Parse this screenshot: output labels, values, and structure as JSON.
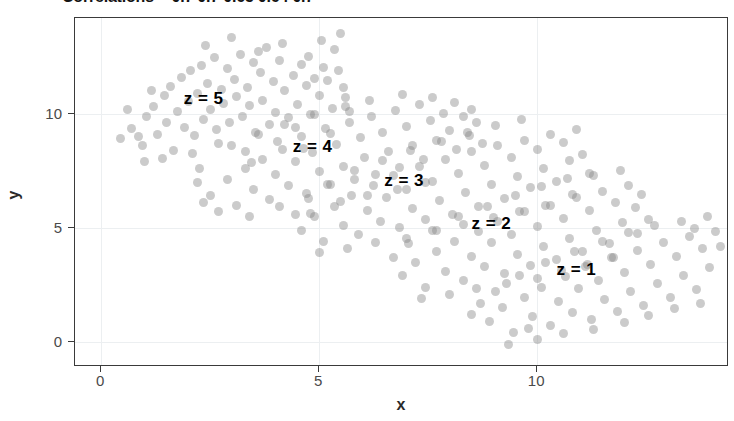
{
  "chart_data": {
    "type": "scatter",
    "title": "Correlations = 0.7 0.7 0.65 0.64 0.7",
    "xlabel": "x",
    "ylabel": "y",
    "xlim": [
      -0.6,
      14.4
    ],
    "ylim": [
      -1.1,
      14.2
    ],
    "xticks": [
      0,
      5,
      10
    ],
    "xticklabels": [
      "0",
      "5",
      "10"
    ],
    "yticks": [
      0,
      5,
      10
    ],
    "yticklabels": [
      "0",
      "5",
      "10"
    ],
    "grid": true,
    "legend": "none",
    "point_color": "#828282",
    "point_alpha": 0.42,
    "annotations": [
      {
        "text": "z = 5",
        "x": 2.35,
        "y": 10.65
      },
      {
        "text": "z = 4",
        "x": 4.85,
        "y": 8.55
      },
      {
        "text": "z = 3",
        "x": 6.95,
        "y": 7.05
      },
      {
        "text": "z = 2",
        "x": 8.95,
        "y": 5.15
      },
      {
        "text": "z = 1",
        "x": 10.9,
        "y": 3.15
      }
    ],
    "series": [
      {
        "name": "z = 5",
        "correlation": 0.7,
        "points": [
          [
            0.45,
            8.9
          ],
          [
            0.7,
            9.35
          ],
          [
            0.95,
            8.6
          ],
          [
            1.05,
            9.9
          ],
          [
            1.2,
            10.3
          ],
          [
            1.3,
            9.1
          ],
          [
            1.45,
            10.8
          ],
          [
            1.5,
            9.6
          ],
          [
            1.6,
            11.2
          ],
          [
            1.65,
            8.4
          ],
          [
            1.75,
            10.1
          ],
          [
            1.85,
            11.6
          ],
          [
            1.9,
            9.4
          ],
          [
            2.0,
            10.55
          ],
          [
            2.05,
            11.9
          ],
          [
            2.15,
            9.05
          ],
          [
            2.2,
            10.9
          ],
          [
            2.3,
            12.1
          ],
          [
            2.35,
            9.75
          ],
          [
            2.45,
            11.35
          ],
          [
            2.5,
            10.2
          ],
          [
            2.6,
            12.45
          ],
          [
            2.65,
            9.3
          ],
          [
            2.75,
            11.05
          ],
          [
            2.8,
            10.45
          ],
          [
            2.9,
            12.0
          ],
          [
            2.95,
            9.6
          ],
          [
            3.05,
            11.5
          ],
          [
            3.1,
            10.75
          ],
          [
            3.2,
            12.6
          ],
          [
            3.25,
            9.9
          ],
          [
            3.35,
            11.15
          ],
          [
            3.4,
            10.35
          ],
          [
            3.5,
            12.25
          ],
          [
            3.55,
            9.2
          ],
          [
            3.65,
            11.8
          ],
          [
            3.7,
            10.6
          ],
          [
            3.8,
            12.9
          ],
          [
            3.85,
            9.55
          ],
          [
            3.95,
            11.4
          ],
          [
            4.0,
            10.05
          ],
          [
            4.1,
            12.35
          ],
          [
            4.2,
            11.0
          ],
          [
            4.3,
            9.85
          ],
          [
            4.4,
            11.7
          ],
          [
            4.5,
            10.4
          ],
          [
            4.6,
            12.15
          ],
          [
            4.7,
            11.25
          ],
          [
            4.8,
            9.95
          ],
          [
            4.9,
            11.55
          ],
          [
            5.0,
            10.8
          ],
          [
            5.1,
            12.05
          ],
          [
            5.2,
            11.45
          ],
          [
            5.3,
            10.25
          ],
          [
            5.45,
            11.9
          ],
          [
            5.6,
            10.7
          ],
          [
            1.0,
            7.9
          ],
          [
            1.4,
            8.05
          ],
          [
            2.1,
            8.25
          ],
          [
            2.7,
            8.7
          ],
          [
            3.3,
            8.35
          ],
          [
            4.05,
            8.8
          ],
          [
            4.65,
            8.5
          ],
          [
            5.25,
            9.15
          ],
          [
            2.4,
            13.0
          ],
          [
            3.0,
            13.35
          ],
          [
            3.6,
            12.75
          ],
          [
            4.15,
            13.1
          ],
          [
            4.75,
            12.5
          ],
          [
            5.35,
            12.8
          ],
          [
            5.5,
            13.5
          ],
          [
            5.05,
            13.2
          ],
          [
            0.6,
            10.2
          ],
          [
            0.85,
            9.0
          ],
          [
            1.15,
            11.0
          ],
          [
            5.55,
            11.15
          ],
          [
            5.7,
            10.1
          ],
          [
            2.25,
            7.6
          ],
          [
            3.45,
            7.85
          ],
          [
            4.45,
            9.4
          ]
        ]
      },
      {
        "name": "z = 4",
        "correlation": 0.7,
        "points": [
          [
            2.5,
            6.4
          ],
          [
            2.9,
            7.1
          ],
          [
            3.1,
            6.0
          ],
          [
            3.3,
            7.6
          ],
          [
            3.5,
            6.7
          ],
          [
            3.7,
            8.0
          ],
          [
            3.85,
            6.25
          ],
          [
            4.0,
            7.35
          ],
          [
            4.15,
            8.45
          ],
          [
            4.3,
            6.85
          ],
          [
            4.45,
            7.9
          ],
          [
            4.6,
            9.0
          ],
          [
            4.7,
            6.5
          ],
          [
            4.85,
            8.3
          ],
          [
            5.0,
            7.45
          ],
          [
            5.15,
            9.35
          ],
          [
            5.25,
            6.9
          ],
          [
            5.4,
            8.65
          ],
          [
            5.55,
            7.7
          ],
          [
            5.7,
            9.6
          ],
          [
            5.8,
            7.1
          ],
          [
            5.95,
            8.95
          ],
          [
            6.05,
            8.1
          ],
          [
            6.2,
            9.9
          ],
          [
            6.3,
            7.35
          ],
          [
            6.45,
            9.2
          ],
          [
            6.6,
            8.35
          ],
          [
            6.75,
            10.15
          ],
          [
            6.85,
            7.65
          ],
          [
            7.0,
            9.45
          ],
          [
            7.15,
            8.6
          ],
          [
            7.3,
            10.4
          ],
          [
            7.4,
            8.0
          ],
          [
            7.55,
            9.7
          ],
          [
            7.7,
            8.85
          ],
          [
            7.85,
            10.0
          ],
          [
            8.0,
            9.25
          ],
          [
            8.15,
            8.45
          ],
          [
            8.3,
            9.9
          ],
          [
            8.45,
            9.05
          ],
          [
            3.0,
            8.6
          ],
          [
            3.6,
            9.1
          ],
          [
            4.2,
            9.55
          ],
          [
            4.9,
            9.95
          ],
          [
            5.6,
            10.3
          ],
          [
            6.15,
            10.6
          ],
          [
            6.9,
            10.85
          ],
          [
            7.6,
            10.7
          ],
          [
            2.7,
            5.7
          ],
          [
            3.4,
            5.5
          ],
          [
            4.1,
            5.95
          ],
          [
            4.8,
            5.65
          ],
          [
            5.5,
            6.15
          ],
          [
            6.1,
            6.4
          ],
          [
            6.8,
            6.7
          ],
          [
            7.45,
            7.0
          ],
          [
            8.6,
            9.6
          ],
          [
            8.75,
            8.7
          ],
          [
            2.2,
            7.0
          ],
          [
            2.35,
            6.1
          ],
          [
            8.1,
            10.5
          ],
          [
            8.5,
            10.2
          ]
        ]
      },
      {
        "name": "z = 3",
        "correlation": 0.65,
        "points": [
          [
            4.6,
            4.9
          ],
          [
            4.9,
            5.5
          ],
          [
            5.1,
            4.4
          ],
          [
            5.35,
            5.95
          ],
          [
            5.55,
            5.1
          ],
          [
            5.75,
            6.4
          ],
          [
            5.9,
            4.7
          ],
          [
            6.1,
            5.75
          ],
          [
            6.25,
            6.85
          ],
          [
            6.4,
            5.3
          ],
          [
            6.55,
            6.35
          ],
          [
            6.7,
            7.3
          ],
          [
            6.85,
            5.0
          ],
          [
            7.0,
            6.7
          ],
          [
            7.15,
            5.85
          ],
          [
            7.3,
            7.7
          ],
          [
            7.45,
            5.35
          ],
          [
            7.6,
            7.05
          ],
          [
            7.75,
            6.2
          ],
          [
            7.9,
            8.0
          ],
          [
            8.05,
            5.6
          ],
          [
            8.2,
            7.4
          ],
          [
            8.35,
            6.55
          ],
          [
            8.5,
            8.35
          ],
          [
            8.65,
            5.95
          ],
          [
            8.8,
            7.75
          ],
          [
            8.95,
            6.9
          ],
          [
            9.1,
            8.6
          ],
          [
            9.25,
            6.3
          ],
          [
            9.4,
            8.1
          ],
          [
            9.55,
            7.25
          ],
          [
            9.7,
            8.85
          ],
          [
            9.85,
            6.75
          ],
          [
            10.0,
            8.45
          ],
          [
            10.15,
            7.6
          ],
          [
            10.3,
            9.1
          ],
          [
            10.45,
            7.05
          ],
          [
            10.6,
            8.75
          ],
          [
            10.75,
            7.95
          ],
          [
            10.9,
            9.3
          ],
          [
            5.2,
            6.9
          ],
          [
            5.8,
            7.5
          ],
          [
            6.45,
            7.95
          ],
          [
            7.1,
            8.4
          ],
          [
            7.8,
            8.8
          ],
          [
            8.4,
            9.2
          ],
          [
            9.05,
            9.5
          ],
          [
            9.65,
            9.75
          ],
          [
            5.0,
            3.9
          ],
          [
            5.65,
            4.1
          ],
          [
            6.3,
            4.35
          ],
          [
            7.0,
            4.55
          ],
          [
            7.7,
            4.9
          ],
          [
            8.3,
            5.15
          ],
          [
            9.0,
            5.45
          ],
          [
            9.6,
            5.7
          ],
          [
            10.2,
            6.0
          ],
          [
            10.8,
            6.45
          ],
          [
            4.45,
            5.6
          ],
          [
            11.05,
            8.2
          ],
          [
            11.2,
            7.4
          ],
          [
            4.75,
            6.3
          ]
        ]
      },
      {
        "name": "z = 2",
        "correlation": 0.64,
        "points": [
          [
            6.9,
            2.9
          ],
          [
            7.2,
            3.5
          ],
          [
            7.45,
            2.4
          ],
          [
            7.7,
            3.95
          ],
          [
            7.9,
            3.1
          ],
          [
            8.1,
            4.4
          ],
          [
            8.3,
            2.7
          ],
          [
            8.5,
            3.75
          ],
          [
            8.65,
            4.85
          ],
          [
            8.8,
            3.3
          ],
          [
            8.95,
            4.35
          ],
          [
            9.1,
            5.3
          ],
          [
            9.25,
            3.0
          ],
          [
            9.4,
            4.7
          ],
          [
            9.55,
            3.85
          ],
          [
            9.7,
            5.7
          ],
          [
            9.85,
            3.35
          ],
          [
            10.0,
            5.05
          ],
          [
            10.15,
            4.2
          ],
          [
            10.3,
            6.0
          ],
          [
            10.45,
            3.6
          ],
          [
            10.6,
            5.4
          ],
          [
            10.75,
            4.55
          ],
          [
            10.9,
            6.35
          ],
          [
            11.05,
            3.95
          ],
          [
            11.2,
            5.75
          ],
          [
            11.35,
            4.9
          ],
          [
            11.5,
            6.6
          ],
          [
            11.65,
            4.3
          ],
          [
            11.8,
            6.1
          ],
          [
            11.95,
            5.25
          ],
          [
            12.1,
            6.85
          ],
          [
            7.6,
            4.9
          ],
          [
            8.2,
            5.5
          ],
          [
            8.85,
            5.95
          ],
          [
            9.5,
            6.4
          ],
          [
            10.1,
            6.8
          ],
          [
            10.7,
            7.15
          ],
          [
            11.3,
            7.3
          ],
          [
            11.9,
            7.5
          ],
          [
            7.35,
            1.9
          ],
          [
            8.0,
            2.1
          ],
          [
            8.6,
            2.35
          ],
          [
            9.3,
            2.55
          ],
          [
            10.0,
            2.8
          ],
          [
            10.55,
            3.15
          ],
          [
            11.15,
            3.4
          ],
          [
            11.75,
            3.7
          ],
          [
            12.25,
            5.9
          ],
          [
            12.4,
            6.45
          ],
          [
            6.7,
            3.7
          ],
          [
            12.3,
            4.75
          ],
          [
            7.05,
            4.3
          ],
          [
            12.55,
            5.35
          ]
        ]
      },
      {
        "name": "z = 1",
        "correlation": 0.7,
        "points": [
          [
            8.9,
            0.9
          ],
          [
            9.2,
            1.5
          ],
          [
            9.45,
            0.4
          ],
          [
            9.7,
            1.95
          ],
          [
            9.9,
            1.1
          ],
          [
            10.1,
            2.4
          ],
          [
            10.3,
            0.7
          ],
          [
            10.5,
            1.75
          ],
          [
            10.65,
            2.85
          ],
          [
            10.8,
            1.3
          ],
          [
            10.95,
            2.35
          ],
          [
            11.1,
            3.3
          ],
          [
            11.25,
            1.0
          ],
          [
            11.4,
            2.7
          ],
          [
            11.55,
            1.85
          ],
          [
            11.7,
            3.7
          ],
          [
            11.85,
            1.35
          ],
          [
            12.0,
            3.05
          ],
          [
            12.15,
            2.2
          ],
          [
            12.3,
            4.0
          ],
          [
            12.45,
            1.6
          ],
          [
            12.6,
            3.4
          ],
          [
            12.75,
            2.55
          ],
          [
            12.9,
            4.35
          ],
          [
            13.05,
            1.95
          ],
          [
            13.2,
            3.75
          ],
          [
            13.35,
            2.9
          ],
          [
            13.5,
            4.6
          ],
          [
            13.65,
            2.3
          ],
          [
            13.8,
            4.1
          ],
          [
            13.95,
            3.25
          ],
          [
            14.1,
            4.85
          ],
          [
            9.6,
            2.9
          ],
          [
            10.2,
            3.5
          ],
          [
            10.85,
            3.95
          ],
          [
            11.5,
            4.4
          ],
          [
            12.1,
            4.8
          ],
          [
            12.7,
            5.1
          ],
          [
            13.3,
            5.3
          ],
          [
            13.9,
            5.5
          ],
          [
            9.35,
            -0.1
          ],
          [
            10.0,
            0.1
          ],
          [
            10.6,
            0.35
          ],
          [
            11.3,
            0.55
          ],
          [
            12.0,
            0.85
          ],
          [
            12.55,
            1.15
          ],
          [
            13.15,
            1.45
          ],
          [
            13.75,
            1.7
          ],
          [
            8.7,
            1.7
          ],
          [
            8.5,
            1.2
          ],
          [
            14.2,
            4.2
          ],
          [
            13.6,
            4.95
          ],
          [
            9.05,
            2.2
          ],
          [
            9.8,
            0.6
          ]
        ]
      }
    ]
  }
}
